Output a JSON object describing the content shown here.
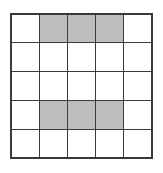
{
  "figure": {
    "rows": 5,
    "columns": 5,
    "cell_shaded_label": "shaded",
    "cell_empty_label": "empty",
    "colors": {
      "background": "#ffffff",
      "cell_empty_fill": "#ffffff",
      "cell_shaded_fill": "#bdbdbd",
      "grid_line": "#3a3a3a",
      "outer_border": "#3a3a3a"
    },
    "grid": [
      [
        "empty",
        "shaded",
        "shaded",
        "shaded",
        "empty"
      ],
      [
        "empty",
        "empty",
        "empty",
        "empty",
        "empty"
      ],
      [
        "empty",
        "empty",
        "empty",
        "empty",
        "empty"
      ],
      [
        "empty",
        "shaded",
        "shaded",
        "shaded",
        "empty"
      ],
      [
        "empty",
        "empty",
        "empty",
        "empty",
        "empty"
      ]
    ],
    "shaded_count": 6,
    "total_cells": 25
  }
}
